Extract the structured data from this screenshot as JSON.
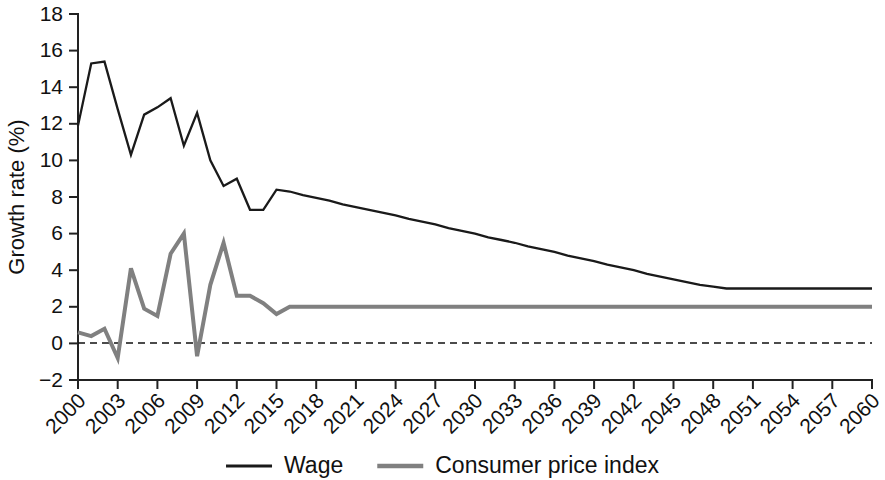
{
  "chart_data": {
    "type": "line",
    "title": "",
    "xlabel": "",
    "ylabel": "Growth rate (%)",
    "ylim": [
      -2,
      18
    ],
    "xlim": [
      2000,
      2060
    ],
    "yticks": [
      -2,
      0,
      2,
      4,
      6,
      8,
      10,
      12,
      14,
      16,
      18
    ],
    "ytick_labels": [
      "−2",
      "0",
      "2",
      "4",
      "6",
      "8",
      "10",
      "12",
      "14",
      "16",
      "18"
    ],
    "xticks": [
      2000,
      2003,
      2006,
      2009,
      2012,
      2015,
      2018,
      2021,
      2024,
      2027,
      2030,
      2033,
      2036,
      2039,
      2042,
      2045,
      2048,
      2051,
      2054,
      2057,
      2060
    ],
    "xtick_labels": [
      "2000",
      "2003",
      "2006",
      "2009",
      "2012",
      "2015",
      "2018",
      "2021",
      "2024",
      "2027",
      "2030",
      "2033",
      "2036",
      "2039",
      "2042",
      "2045",
      "2048",
      "2051",
      "2054",
      "2057",
      "2060"
    ],
    "grid": false,
    "legend_position": "bottom",
    "zero_reference_line": {
      "value": 0,
      "style": "dashed"
    },
    "x": [
      2000,
      2001,
      2002,
      2003,
      2004,
      2005,
      2006,
      2007,
      2008,
      2009,
      2010,
      2011,
      2012,
      2013,
      2014,
      2015,
      2016,
      2017,
      2018,
      2019,
      2020,
      2021,
      2022,
      2023,
      2024,
      2025,
      2026,
      2027,
      2028,
      2029,
      2030,
      2031,
      2032,
      2033,
      2034,
      2035,
      2036,
      2037,
      2038,
      2039,
      2040,
      2041,
      2042,
      2043,
      2044,
      2045,
      2046,
      2047,
      2048,
      2049,
      2050,
      2051,
      2052,
      2053,
      2054,
      2055,
      2056,
      2057,
      2058,
      2059,
      2060
    ],
    "series": [
      {
        "name": "Wage",
        "color": "#1a1a1a",
        "values": [
          11.9,
          15.3,
          15.4,
          12.8,
          10.3,
          12.5,
          12.9,
          13.4,
          10.8,
          12.6,
          10.0,
          8.6,
          9.0,
          7.3,
          7.3,
          8.4,
          8.3,
          8.1,
          7.95,
          7.8,
          7.6,
          7.45,
          7.3,
          7.15,
          7.0,
          6.8,
          6.65,
          6.5,
          6.3,
          6.15,
          6.0,
          5.8,
          5.65,
          5.5,
          5.3,
          5.15,
          5.0,
          4.8,
          4.65,
          4.5,
          4.3,
          4.15,
          4.0,
          3.8,
          3.65,
          3.5,
          3.35,
          3.2,
          3.1,
          3.0,
          3.0,
          3.0,
          3.0,
          3.0,
          3.0,
          3.0,
          3.0,
          3.0,
          3.0,
          3.0,
          3.0
        ]
      },
      {
        "name": "Consumer price index",
        "color": "#808080",
        "values": [
          0.6,
          0.4,
          0.8,
          -0.8,
          4.1,
          1.9,
          1.5,
          4.9,
          6.0,
          -0.7,
          3.2,
          5.5,
          2.6,
          2.6,
          2.2,
          1.6,
          2.0,
          2.0,
          2.0,
          2.0,
          2.0,
          2.0,
          2.0,
          2.0,
          2.0,
          2.0,
          2.0,
          2.0,
          2.0,
          2.0,
          2.0,
          2.0,
          2.0,
          2.0,
          2.0,
          2.0,
          2.0,
          2.0,
          2.0,
          2.0,
          2.0,
          2.0,
          2.0,
          2.0,
          2.0,
          2.0,
          2.0,
          2.0,
          2.0,
          2.0,
          2.0,
          2.0,
          2.0,
          2.0,
          2.0,
          2.0,
          2.0,
          2.0,
          2.0,
          2.0,
          2.0
        ]
      }
    ]
  },
  "legend": {
    "items": [
      {
        "label": "Wage",
        "color": "#1a1a1a"
      },
      {
        "label": "Consumer price index",
        "color": "#808080"
      }
    ]
  },
  "axes": {
    "y_title": "Growth rate (%)"
  }
}
